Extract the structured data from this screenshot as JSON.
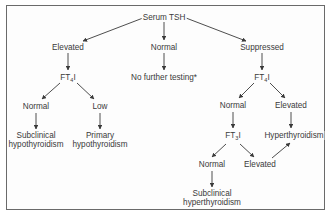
{
  "diagram": {
    "type": "flowchart",
    "title": "",
    "colors": {
      "line": "#3a3a3a",
      "text": "#3a3a3a",
      "border": "#6a6a6a",
      "background": "#fdfdfd"
    },
    "nodes": {
      "root": {
        "label": "Serum TSH"
      },
      "elevated": {
        "label": "Elevated"
      },
      "normal_tsh": {
        "label": "Normal"
      },
      "suppressed": {
        "label": "Suppressed"
      },
      "ft4i_left": {
        "prefix": "FT",
        "sub": "4",
        "suffix": "I"
      },
      "no_further": {
        "label": "No further testing*"
      },
      "ft4i_right": {
        "prefix": "FT",
        "sub": "4",
        "suffix": "I"
      },
      "left_normal": {
        "label": "Normal"
      },
      "left_low": {
        "label": "Low"
      },
      "subclinical_hypo": {
        "line1": "Subclinical",
        "line2": "hypothyroidism"
      },
      "primary_hypo": {
        "line1": "Primary",
        "line2": "hypothyroidism"
      },
      "right_normal": {
        "label": "Normal"
      },
      "right_elevated": {
        "label": "Elevated"
      },
      "ft3i": {
        "prefix": "FT",
        "sub": "3",
        "suffix": "I"
      },
      "hyperthyroidism": {
        "label": "Hyperthyroidism"
      },
      "ft3_normal": {
        "label": "Normal"
      },
      "ft3_elevated": {
        "label": "Elevated"
      },
      "subclinical_hyper": {
        "line1": "Subclinical",
        "line2": "hyperthyroidism"
      }
    },
    "edges": [
      [
        "root",
        "elevated"
      ],
      [
        "root",
        "normal_tsh"
      ],
      [
        "root",
        "suppressed"
      ],
      [
        "elevated",
        "ft4i_left"
      ],
      [
        "normal_tsh",
        "no_further"
      ],
      [
        "suppressed",
        "ft4i_right"
      ],
      [
        "ft4i_left",
        "left_normal"
      ],
      [
        "ft4i_left",
        "left_low"
      ],
      [
        "left_normal",
        "subclinical_hypo"
      ],
      [
        "left_low",
        "primary_hypo"
      ],
      [
        "ft4i_right",
        "right_normal"
      ],
      [
        "ft4i_right",
        "right_elevated"
      ],
      [
        "right_elevated",
        "hyperthyroidism"
      ],
      [
        "right_normal",
        "ft3i"
      ],
      [
        "ft3i",
        "ft3_normal"
      ],
      [
        "ft3i",
        "ft3_elevated"
      ],
      [
        "ft3_elevated",
        "hyperthyroidism"
      ],
      [
        "ft3_normal",
        "subclinical_hyper"
      ]
    ]
  }
}
